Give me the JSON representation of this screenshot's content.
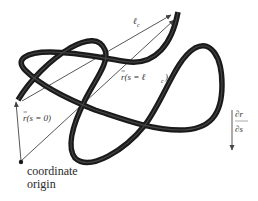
{
  "figure": {
    "labels": {
      "contour_length": "ℓ",
      "contour_length_sub": "c",
      "end_vector": "r(s = ℓ",
      "end_vector_sub": "c",
      "end_vector_close": ")",
      "start_vector": "r(s = 0)",
      "tangent_numerator": "∂r",
      "tangent_denominator": "∂s",
      "origin_line1": "coordinate",
      "origin_line2": "origin"
    },
    "colors": {
      "tube": "#1a1a1a",
      "tube_highlight": "#6a6a6a",
      "vector_line": "#444444",
      "text": "#333333",
      "background": "#ffffff"
    }
  }
}
